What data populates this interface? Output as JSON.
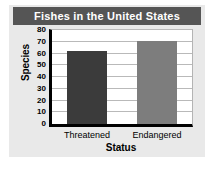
{
  "chart_data": {
    "type": "bar",
    "title": "Fishes in the United States",
    "xlabel": "Status",
    "ylabel": "Species",
    "categories": [
      "Threatened",
      "Endangered"
    ],
    "values": [
      62,
      71
    ],
    "ylim": [
      0,
      80
    ],
    "yticks": [
      80,
      70,
      60,
      50,
      40,
      30,
      20,
      10,
      0
    ],
    "ytick_labels": [
      "80",
      "70",
      "60",
      "50",
      "40",
      "30",
      "20",
      "10",
      "0"
    ],
    "grid": true,
    "legend": false,
    "bar_colors": [
      "#3b3b3b",
      "#7d7d7d"
    ]
  },
  "style": {
    "title_bar_color": "#555555",
    "title_text_color": "#ffffff",
    "panel_background": "#e9e9e9",
    "plot_background": "#ffffff",
    "axis_color": "#000000",
    "gridline_color": "#b9b9b9"
  }
}
